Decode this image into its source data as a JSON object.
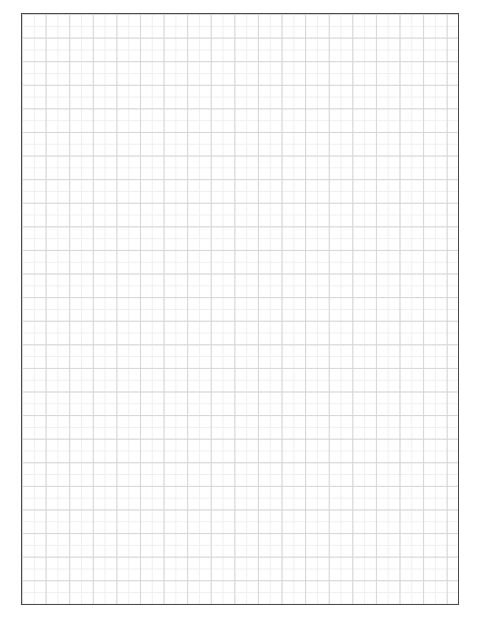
{
  "page": {
    "type": "graph-paper",
    "grid": {
      "major_cell_px": 23.6,
      "minor_cell_px": 11.8,
      "major_line_color": "#d6d6d6",
      "minor_line_color": "#efefef",
      "border_color": "#4a4a4a"
    }
  }
}
